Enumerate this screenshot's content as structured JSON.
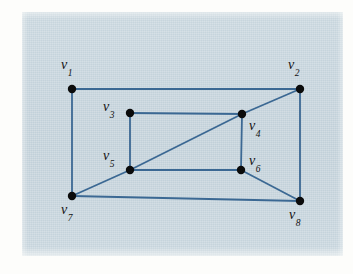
{
  "figure": {
    "domain": "Diagram",
    "kind": "graph-diagram",
    "panel": {
      "background_color": "#c3d2da",
      "page_color": "#fdfdfb",
      "x": 22,
      "y": 12,
      "width": 321,
      "height": 244
    },
    "style": {
      "edge_color": "#3b6893",
      "edge_width": 1.8,
      "vertex_color": "#0b0b0b",
      "vertex_radius": 4.2,
      "label_color": "#121212"
    }
  },
  "graph": {
    "vertices": [
      {
        "id": "v1",
        "label": "v",
        "subscript": "1",
        "x": 72,
        "y": 89,
        "label_x": 61,
        "label_y": 58
      },
      {
        "id": "v2",
        "label": "v",
        "subscript": "2",
        "x": 300,
        "y": 89,
        "label_x": 288,
        "label_y": 58
      },
      {
        "id": "v3",
        "label": "v",
        "subscript": "3",
        "x": 130,
        "y": 113,
        "label_x": 103,
        "label_y": 100
      },
      {
        "id": "v4",
        "label": "v",
        "subscript": "4",
        "x": 242,
        "y": 114,
        "label_x": 249,
        "label_y": 119
      },
      {
        "id": "v5",
        "label": "v",
        "subscript": "5",
        "x": 130,
        "y": 170,
        "label_x": 103,
        "label_y": 149
      },
      {
        "id": "v6",
        "label": "v",
        "subscript": "6",
        "x": 241,
        "y": 170,
        "label_x": 249,
        "label_y": 154
      },
      {
        "id": "v7",
        "label": "v",
        "subscript": "7",
        "x": 72,
        "y": 196,
        "label_x": 61,
        "label_y": 203
      },
      {
        "id": "v8",
        "label": "v",
        "subscript": "8",
        "x": 300,
        "y": 201,
        "label_x": 289,
        "label_y": 208
      }
    ],
    "edges": [
      {
        "from": "v1",
        "to": "v2",
        "name": "edge-v1-v2"
      },
      {
        "from": "v1",
        "to": "v7",
        "name": "edge-v1-v7"
      },
      {
        "from": "v2",
        "to": "v8",
        "name": "edge-v2-v8"
      },
      {
        "from": "v7",
        "to": "v8",
        "name": "edge-v7-v8"
      },
      {
        "from": "v3",
        "to": "v4",
        "name": "edge-v3-v4"
      },
      {
        "from": "v3",
        "to": "v5",
        "name": "edge-v3-v5"
      },
      {
        "from": "v4",
        "to": "v6",
        "name": "edge-v4-v6"
      },
      {
        "from": "v5",
        "to": "v6",
        "name": "edge-v5-v6"
      },
      {
        "from": "v7",
        "to": "v5",
        "name": "edge-v7-v5"
      },
      {
        "from": "v5",
        "to": "v4",
        "name": "edge-v5-v4"
      },
      {
        "from": "v4",
        "to": "v2",
        "name": "edge-v4-v2"
      },
      {
        "from": "v6",
        "to": "v8",
        "name": "edge-v6-v8"
      }
    ],
    "vertex_count": 8,
    "edge_count": 12
  }
}
